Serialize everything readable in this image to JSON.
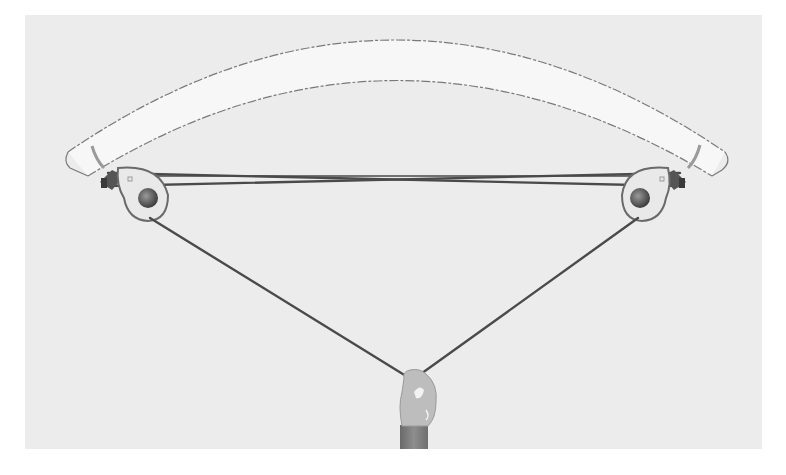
{
  "figure": {
    "colors": {
      "background": "#ffffff",
      "panel": "#ececec",
      "limb_fill": "#f7f7f7",
      "limb_outline": "#7a7a7a",
      "cable": "#4a4a4a",
      "pulley_fill": "#e9e9e9",
      "pulley_rim": "#6a6a6a",
      "axle": "#5a5a5a",
      "hand": "#bdbdbd",
      "sleeve": "#7e7e7e"
    },
    "parts": [
      {
        "id": "limb",
        "label": ""
      },
      {
        "id": "left-pulley",
        "label": ""
      },
      {
        "id": "right-pulley",
        "label": ""
      },
      {
        "id": "upper-cables",
        "label": ""
      },
      {
        "id": "drawstring",
        "label": ""
      },
      {
        "id": "hand",
        "label": ""
      }
    ]
  }
}
